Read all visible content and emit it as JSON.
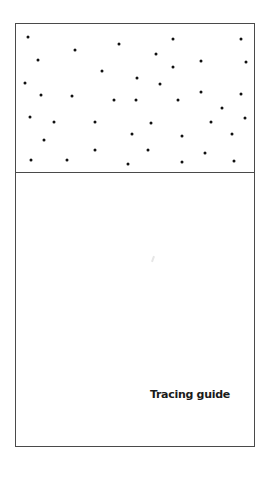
{
  "caption": "Tracing guide",
  "colors": {
    "border": "#4a4a4a",
    "dot": "#111111",
    "text": "#1a1a1a",
    "background": "#ffffff"
  },
  "frame": {
    "left": 15,
    "top": 23,
    "width": 238,
    "height": 422,
    "divider_y": 172
  },
  "dots": [
    [
      27,
      36
    ],
    [
      74,
      49
    ],
    [
      118,
      43
    ],
    [
      172,
      38
    ],
    [
      240,
      38
    ],
    [
      37,
      59
    ],
    [
      155,
      53
    ],
    [
      200,
      60
    ],
    [
      245,
      61
    ],
    [
      172,
      66
    ],
    [
      101,
      70
    ],
    [
      136,
      77
    ],
    [
      159,
      83
    ],
    [
      24,
      82
    ],
    [
      40,
      94
    ],
    [
      71,
      95
    ],
    [
      113,
      99
    ],
    [
      135,
      99
    ],
    [
      177,
      99
    ],
    [
      200,
      91
    ],
    [
      240,
      93
    ],
    [
      221,
      107
    ],
    [
      244,
      117
    ],
    [
      29,
      116
    ],
    [
      53,
      121
    ],
    [
      94,
      121
    ],
    [
      150,
      122
    ],
    [
      210,
      121
    ],
    [
      131,
      133
    ],
    [
      181,
      135
    ],
    [
      231,
      133
    ],
    [
      43,
      139
    ],
    [
      94,
      149
    ],
    [
      147,
      149
    ],
    [
      204,
      152
    ],
    [
      30,
      159
    ],
    [
      66,
      159
    ],
    [
      127,
      163
    ],
    [
      181,
      161
    ],
    [
      233,
      160
    ]
  ]
}
